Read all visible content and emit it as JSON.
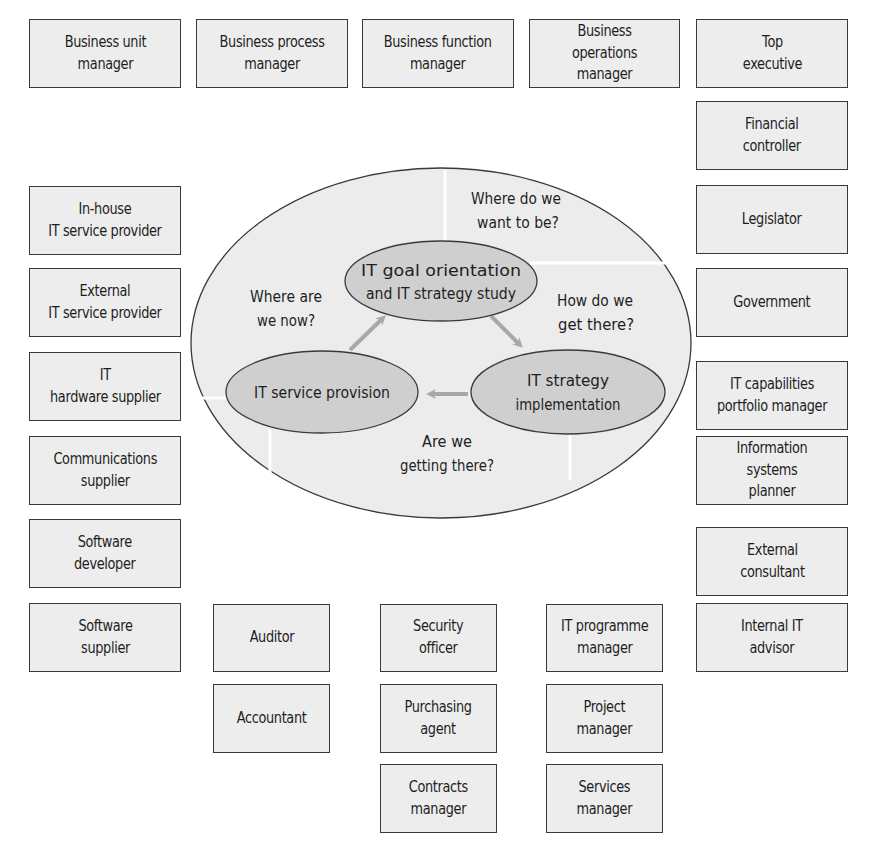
{
  "top_row": [
    {
      "label": "Business unit\nmanager"
    },
    {
      "label": "Business process\nmanager"
    },
    {
      "label": "Business function\nmanager"
    },
    {
      "label": "Business operations\nmanager"
    },
    {
      "label": "Top\nexecutive"
    }
  ],
  "right_column": [
    {
      "label": "Financial\ncontroller"
    },
    {
      "label": "Legislator"
    },
    {
      "label": "Government"
    },
    {
      "label": "IT capabilities\nportfolio manager"
    },
    {
      "label": "Information systems\nplanner"
    },
    {
      "label": "External\nconsultant"
    },
    {
      "label": "Internal IT\nadvisor"
    }
  ],
  "left_column": [
    {
      "label": "In-house\nIT service provider"
    },
    {
      "label": "External\nIT service provider"
    },
    {
      "label": "IT\nhardware supplier"
    },
    {
      "label": "Communications\nsupplier"
    },
    {
      "label": "Software\ndeveloper"
    },
    {
      "label": "Software\nsupplier"
    }
  ],
  "bottom_left": [
    {
      "label": "Auditor"
    },
    {
      "label": "Accountant"
    }
  ],
  "bottom_middle": [
    {
      "label": "Security\nofficer"
    },
    {
      "label": "Purchasing\nagent"
    },
    {
      "label": "Contracts\nmanager"
    }
  ],
  "bottom_right": [
    {
      "label": "IT programme\nmanager"
    },
    {
      "label": "Project\nmanager"
    },
    {
      "label": "Services\nmanager"
    }
  ],
  "cycle": {
    "nodes": {
      "goal": {
        "line1": "IT goal orientation",
        "line2": "and IT strategy study"
      },
      "implementation": {
        "line1": "IT strategy",
        "line2": "implementation"
      },
      "provision": {
        "line1": "IT service provision"
      }
    },
    "questions": {
      "want": {
        "line1": "Where do we",
        "line2": "want to be?"
      },
      "now": {
        "line1": "Where are",
        "line2": "we now?"
      },
      "how": {
        "line1": "How do we",
        "line2": "get there?"
      },
      "getting": {
        "line1": "Are we",
        "line2": "getting there?"
      }
    }
  },
  "colors": {
    "outer_ellipse": "#ececec",
    "inner_ellipse": "#cfcfcf",
    "arrow": "#a8a8a8",
    "box_fill": "#ededed",
    "border": "#3a3a3a"
  }
}
